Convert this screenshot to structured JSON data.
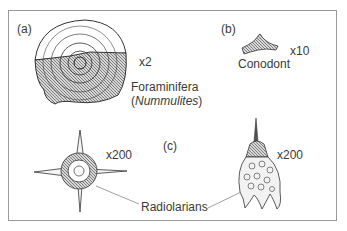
{
  "panels": {
    "a": {
      "tag": "(a)",
      "magnification": "x2",
      "name_line1": "Foraminifera",
      "name_open": "(",
      "name_italic": "Nummulites",
      "name_close": ")"
    },
    "b": {
      "tag": "(b)",
      "magnification": "x10",
      "name": "Conodont"
    },
    "c": {
      "tag": "(c)",
      "magnification_left": "x200",
      "magnification_right": "x200",
      "name": "Radiolarians"
    }
  }
}
